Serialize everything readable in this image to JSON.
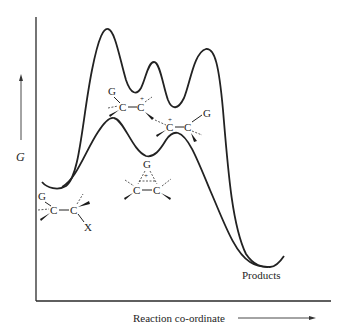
{
  "figure": {
    "type": "reaction energy profile",
    "y_axis_label": "G",
    "x_axis_label": "Reaction co-ordinate",
    "products_label": "Products",
    "curves": [
      {
        "name": "upper",
        "description": "stepwise path via open carbocations",
        "maxima": 3,
        "intermediate_minima": 2
      },
      {
        "name": "lower",
        "description": "neighbouring group participation via bridged ion",
        "maxima": 2,
        "intermediate_minima": 1
      }
    ],
    "structures": {
      "reactant": {
        "atoms": [
          "G",
          "C",
          "C",
          "X"
        ]
      },
      "open_cation_1": {
        "atoms": [
          "G",
          "C",
          "C"
        ],
        "charge": "+"
      },
      "open_cation_2": {
        "atoms": [
          "C",
          "C",
          "G"
        ],
        "charge": "+"
      },
      "bridged_ion": {
        "atoms": [
          "G",
          "C",
          "C"
        ],
        "charge": "+"
      }
    }
  },
  "labels": {
    "G": "G",
    "C": "C",
    "X": "X",
    "plus": "+",
    "products": "Products",
    "reaction_coordinate": "Reaction co-ordinate"
  }
}
